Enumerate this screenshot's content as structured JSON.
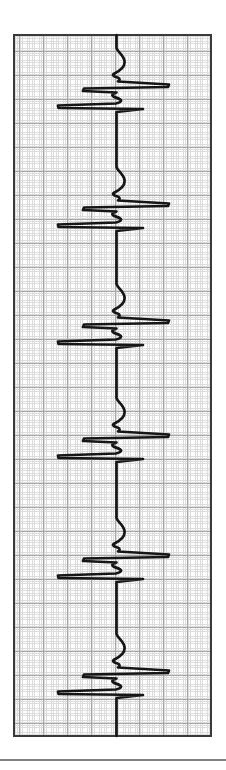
{
  "figure": {
    "kind": "ecg-rhythm-strip-vertical",
    "colors": {
      "trace": "#161616",
      "grid_fine": "#dcdcdc",
      "grid_bold": "#a6a6a6",
      "strip_border": "#3a3a3a",
      "paper": "#ffffff",
      "divider": "#828282"
    }
  },
  "chart_data": {
    "type": "line",
    "title": "",
    "orientation": "vertical-time-downward",
    "canvas": {
      "width": 226,
      "height": 770
    },
    "strip": {
      "left": 13,
      "top": 34,
      "width": 199,
      "height": 703,
      "border_px": 2
    },
    "grid": {
      "fine_spacing_px": 2.4,
      "bold_spacing_px": 24,
      "bold_x_phase_px": 4,
      "bold_y_phase_px": 15
    },
    "baseline_x": 116.5,
    "trace_top_y": 35,
    "trace_bottom_y": 736,
    "beat_count": 6,
    "beat_r_y": [
      84,
      203,
      320,
      434,
      554,
      670
    ],
    "beat_interval_px": 117,
    "qrs": {
      "r_bar_right_x": 169,
      "r_bar_left_x": 83,
      "s_bar_left_x": 58,
      "s_bar_right_x": 143,
      "bar_gap_px": 21
    },
    "p_wave": {
      "peak_x": 124.5,
      "onset_offset_y": -36
    },
    "beat_template": [
      [
        "L",
        0,
        -36
      ],
      [
        "C",
        1,
        -32,
        7,
        -29,
        8,
        -23
      ],
      [
        "C",
        9,
        -17,
        4,
        -13.5,
        -2,
        -10.5
      ],
      [
        "C",
        -5,
        -9,
        -3,
        -7.5,
        1,
        -6.5
      ],
      [
        "C",
        4,
        -5.5,
        3.5,
        -3.5,
        1.5,
        -2.5
      ],
      [
        "L",
        52.5,
        0.5
      ],
      [
        "L",
        51.5,
        3
      ],
      [
        "L",
        -32.5,
        4.5
      ],
      [
        "L",
        -33.5,
        7
      ],
      [
        "L",
        0,
        8.5
      ],
      [
        "C",
        -3.5,
        9.5,
        -5.5,
        11,
        -3,
        12.5
      ],
      [
        "C",
        -0.5,
        14,
        4,
        14.5,
        4.5,
        16.5
      ],
      [
        "C",
        5,
        18,
        1.5,
        19,
        -0.5,
        19.5
      ],
      [
        "L",
        -58.5,
        21.5
      ],
      [
        "L",
        -58,
        24
      ],
      [
        "L",
        26.5,
        25
      ],
      [
        "L",
        0,
        28
      ]
    ],
    "divider_y": 759
  }
}
